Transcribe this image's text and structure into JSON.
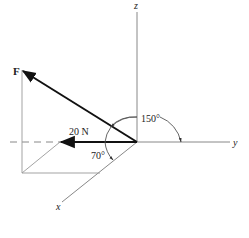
{
  "diagram": {
    "type": "3d-force-vector",
    "axes": {
      "x_label": "x",
      "y_label": "y",
      "z_label": "z"
    },
    "force": {
      "label": "F"
    },
    "component": {
      "label": "20 N"
    },
    "angles": {
      "angle_150": "150°",
      "angle_70": "70°"
    },
    "colors": {
      "line": "#888888",
      "vector": "#111111",
      "text": "#222222"
    }
  }
}
